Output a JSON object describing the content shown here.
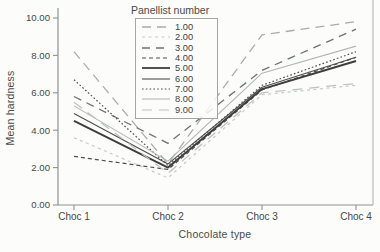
{
  "chart_data": {
    "type": "line",
    "title": "",
    "legend_title": "Panellist number",
    "xlabel": "Chocolate type",
    "ylabel": "Mean hardness",
    "categories": [
      "Choc 1",
      "Choc 2",
      "Choc 3",
      "Choc 4"
    ],
    "yticks": [
      "0.00",
      "2.00",
      "4.00",
      "6.00",
      "8.00",
      "10.00"
    ],
    "ylim": [
      0,
      10.4
    ],
    "grid": false,
    "legend_position": "top-center-inside",
    "axis_color": "#8e9292",
    "text_color": "#474747",
    "series": [
      {
        "name": "1.00",
        "values": [
          8.2,
          2.2,
          9.1,
          9.8
        ],
        "color": "#a8acac",
        "dash": "9,6",
        "width": 1.3
      },
      {
        "name": "2.00",
        "values": [
          3.6,
          1.45,
          5.9,
          6.4
        ],
        "color": "#c6caca",
        "dash": "3,3.5",
        "width": 1.2
      },
      {
        "name": "3.00",
        "values": [
          5.8,
          3.3,
          7.2,
          9.4
        ],
        "color": "#6e7272",
        "dash": "8,6",
        "width": 1.3
      },
      {
        "name": "4.00",
        "values": [
          2.6,
          1.9,
          6.15,
          7.9
        ],
        "color": "#4e4e4e",
        "dash": "4,3",
        "width": 1.2
      },
      {
        "name": "5.00",
        "values": [
          4.5,
          2.0,
          6.2,
          7.7
        ],
        "color": "#3e3e3e",
        "dash": "",
        "width": 2
      },
      {
        "name": "6.00",
        "values": [
          4.9,
          2.2,
          6.3,
          7.9
        ],
        "color": "#4e4e4e",
        "dash": "",
        "width": 1.1
      },
      {
        "name": "7.00",
        "values": [
          6.7,
          2.1,
          6.4,
          8.2
        ],
        "color": "#4e4e4e",
        "dash": "1.6,2.2",
        "width": 1.2
      },
      {
        "name": "8.00",
        "values": [
          5.3,
          2.35,
          7.05,
          8.5
        ],
        "color": "#b2b6b6",
        "dash": "",
        "width": 1.1
      },
      {
        "name": "9.00",
        "values": [
          5.5,
          1.7,
          6.0,
          6.5
        ],
        "color": "#bcc0c0",
        "dash": "10,7",
        "width": 1.2
      }
    ]
  }
}
